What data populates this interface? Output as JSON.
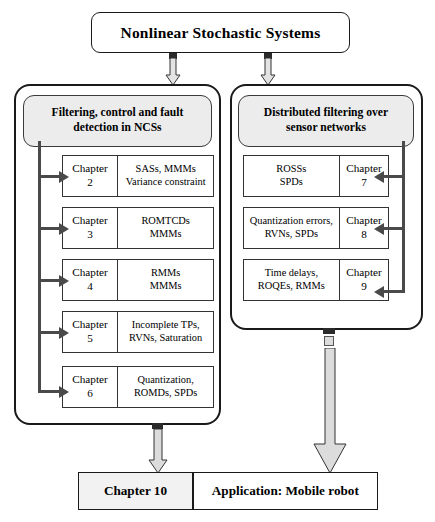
{
  "title": {
    "text": "Nonlinear Stochastic Systems"
  },
  "groups": {
    "left": {
      "header": "Filtering, control and fault detection in NCSs",
      "rows": [
        {
          "chapter": "Chapter 2",
          "topics": "SASs, MMMs Variance constraint"
        },
        {
          "chapter": "Chapter 3",
          "topics": "ROMTCDs MMMs"
        },
        {
          "chapter": "Chapter 4",
          "topics": "RMMs MMMs"
        },
        {
          "chapter": "Chapter 5",
          "topics": "Incomplete TPs, RVNs, Saturation"
        },
        {
          "chapter": "Chapter 6",
          "topics": "Quantization, ROMDs, SPDs"
        }
      ]
    },
    "right": {
      "header": "Distributed filtering over sensor networks",
      "rows": [
        {
          "chapter": "Chapter 7",
          "topics": "ROSSs SPDs"
        },
        {
          "chapter": "Chapter 8",
          "topics": "Quantization errors, RVNs, SPDs"
        },
        {
          "chapter": "Chapter 9",
          "topics": "Time delays, ROQEs, RMMs"
        }
      ]
    }
  },
  "bottom": {
    "chapter": "Chapter 10",
    "label": "Application: Mobile robot"
  },
  "lines": {
    "l2a": "SASs, MMMs",
    "l2b": "Variance constraint",
    "l3a": "ROMTCDs",
    "l3b": "MMMs",
    "l4a": "RMMs",
    "l4b": "MMMs",
    "l5a": "Incomplete TPs,",
    "l5b": "RVNs, Saturation",
    "l6a": "Quantization,",
    "l6b": "ROMDs, SPDs",
    "r7a": "ROSSs",
    "r7b": "SPDs",
    "r8a": "Quantization errors,",
    "r8b": "RVNs, SPDs",
    "r9a": "Time delays,",
    "r9b": "ROQEs, RMMs",
    "lh1": "Filtering, control and fault",
    "lh2": "detection in NCSs",
    "rh1": "Distributed filtering over",
    "rh2": "sensor networks",
    "n2": "Chapter",
    "v2": "2",
    "n3": "Chapter",
    "v3": "3",
    "n4": "Chapter",
    "v4": "4",
    "n5": "Chapter",
    "v5": "5",
    "n6": "Chapter",
    "v6": "6",
    "n7": "Chapter",
    "v7": "7",
    "n8": "Chapter",
    "v8": "8",
    "n9": "Chapter",
    "v9": "9"
  },
  "colors": {
    "stroke": "#1a1a1a",
    "header_fill": "#ececec",
    "arrow_gray": "#4a4a4a",
    "block_arrow_fill": "#d9d9d9"
  }
}
